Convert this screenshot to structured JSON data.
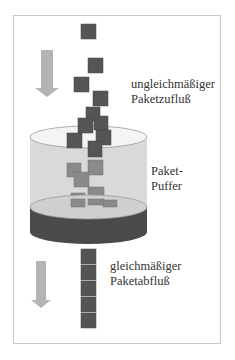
{
  "diagram": {
    "type": "packet-buffer (leaky bucket) illustration",
    "labels": {
      "inflow_line1": "ungleichmäßiger",
      "inflow_line2": "Paketzufluß",
      "buffer_line1": "Paket-",
      "buffer_line2": "Puffer",
      "outflow_line1": "gleichmäßiger",
      "outflow_line2": "Paketabfluß"
    },
    "colors": {
      "packet": "#555555",
      "packet_in_buffer": "#8a8a8a",
      "arrow": "#b4b4b4",
      "cylinder_wall": "#d9d9d9",
      "cylinder_bottom": "#4a4a4a",
      "frame": "#c8c8c8"
    },
    "incoming_packets": 11,
    "buffered_packets": 6,
    "outgoing_packets": 5
  }
}
